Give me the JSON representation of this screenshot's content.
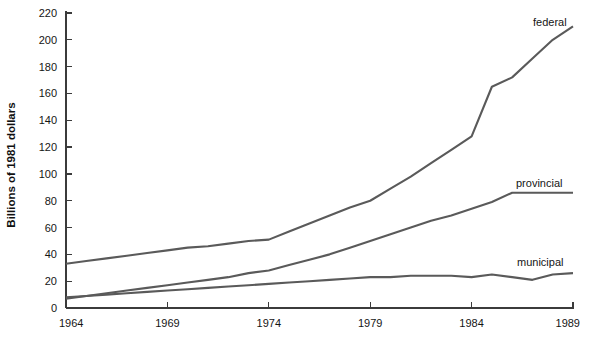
{
  "chart_data": {
    "type": "line",
    "title": "",
    "subtitle": "",
    "xlabel": "",
    "ylabel": "Billions of 1981 dollars",
    "xlim": [
      1964,
      1989
    ],
    "ylim": [
      0,
      220
    ],
    "x_ticks": [
      1964,
      1969,
      1974,
      1979,
      1984,
      1989
    ],
    "x_tick_labels": [
      "1964",
      "1969",
      "1974",
      "1979",
      "1984",
      "1989"
    ],
    "y_ticks": [
      0,
      20,
      40,
      60,
      80,
      100,
      120,
      140,
      160,
      180,
      200,
      220
    ],
    "y_tick_labels": [
      "0",
      "20",
      "40",
      "60",
      "80",
      "100",
      "120",
      "140",
      "160",
      "180",
      "200",
      "220"
    ],
    "grid": false,
    "legend": "inline-labels",
    "x": [
      1964,
      1965,
      1966,
      1967,
      1968,
      1969,
      1970,
      1971,
      1972,
      1973,
      1974,
      1975,
      1976,
      1977,
      1978,
      1979,
      1980,
      1981,
      1982,
      1983,
      1984,
      1985,
      1986,
      1987,
      1988,
      1989
    ],
    "series": [
      {
        "name": "federal",
        "label": "federal",
        "color": "#5a5a5a",
        "values": [
          33,
          35,
          37,
          39,
          41,
          43,
          45,
          46,
          48,
          50,
          51,
          57,
          63,
          69,
          75,
          80,
          89,
          98,
          108,
          118,
          128,
          165,
          172,
          186,
          200,
          210
        ]
      },
      {
        "name": "provincial",
        "label": "provincial",
        "color": "#5a5a5a",
        "values": [
          7,
          9,
          11,
          13,
          15,
          17,
          19,
          21,
          23,
          26,
          28,
          32,
          36,
          40,
          45,
          50,
          55,
          60,
          65,
          69,
          74,
          79,
          86,
          86,
          86,
          86
        ]
      },
      {
        "name": "municipal",
        "label": "municipal",
        "color": "#5a5a5a",
        "values": [
          8,
          9,
          10,
          11,
          12,
          13,
          14,
          15,
          16,
          17,
          18,
          19,
          20,
          21,
          22,
          23,
          23,
          24,
          24,
          24,
          23,
          25,
          23,
          21,
          25,
          26
        ]
      }
    ]
  },
  "axis": {
    "y_title": "Billions of 1981 dollars"
  },
  "labels": {
    "federal": "federal",
    "provincial": "provincial",
    "municipal": "municipal"
  }
}
